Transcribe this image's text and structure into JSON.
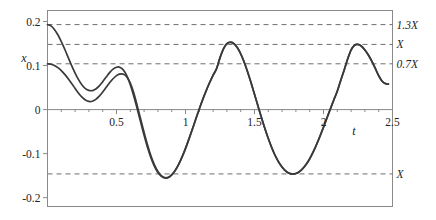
{
  "chart_data": {
    "type": "line",
    "title": "",
    "xlabel": "t",
    "ylabel": "x",
    "xlim": [
      0,
      2.5
    ],
    "ylim": [
      -0.22,
      0.225
    ],
    "grid": false,
    "legend": "none",
    "x_ticks": [
      {
        "value": 0.5,
        "label": "0.5"
      },
      {
        "value": 1.0,
        "label": "1"
      },
      {
        "value": 1.5,
        "label": "1.5"
      },
      {
        "value": 2.0,
        "label": "2"
      },
      {
        "value": 2.5,
        "label": "2.5"
      }
    ],
    "x_minor_tick_step": 0.1,
    "y_ticks": [
      {
        "value": 0.2,
        "label": "0.2"
      },
      {
        "value": 0.1,
        "label": "0.1"
      },
      {
        "value": 0.0,
        "label": "0"
      },
      {
        "value": -0.1,
        "label": "-0.1"
      },
      {
        "value": -0.2,
        "label": "-0.2"
      }
    ],
    "reference_lines": [
      {
        "id": "upper-1-3X",
        "value": 0.193,
        "label": "1.3X",
        "style": "dashed"
      },
      {
        "id": "upper-X",
        "value": 0.148,
        "label": "X",
        "style": "dashed"
      },
      {
        "id": "upper-0-7X",
        "value": 0.104,
        "label": "0.7X",
        "style": "dashed"
      },
      {
        "id": "lower-X",
        "value": -0.146,
        "label": "X",
        "style": "dashed"
      }
    ],
    "series": [
      {
        "name": "response-curve-a",
        "color": "#3a3a3a",
        "start_value": 0.193,
        "points": [
          [
            0.0,
            0.193
          ],
          [
            0.025,
            0.19
          ],
          [
            0.05,
            0.182
          ],
          [
            0.075,
            0.17
          ],
          [
            0.1,
            0.1545
          ],
          [
            0.125,
            0.137
          ],
          [
            0.15,
            0.1185
          ],
          [
            0.175,
            0.1
          ],
          [
            0.2,
            0.083
          ],
          [
            0.225,
            0.068
          ],
          [
            0.25,
            0.056
          ],
          [
            0.275,
            0.0478
          ],
          [
            0.3,
            0.0435
          ],
          [
            0.325,
            0.0432
          ],
          [
            0.35,
            0.0468
          ],
          [
            0.375,
            0.0538
          ],
          [
            0.4,
            0.0632
          ],
          [
            0.425,
            0.0738
          ],
          [
            0.45,
            0.084
          ],
          [
            0.475,
            0.092
          ],
          [
            0.5,
            0.0962
          ],
          [
            0.52,
            0.0965
          ],
          [
            0.54,
            0.093
          ],
          [
            0.56,
            0.0852
          ],
          [
            0.58,
            0.073
          ],
          [
            0.6,
            0.0566
          ],
          [
            0.625,
            0.031
          ],
          [
            0.65,
            0.002
          ],
          [
            0.675,
            -0.0285
          ],
          [
            0.7,
            -0.0585
          ],
          [
            0.725,
            -0.0862
          ],
          [
            0.75,
            -0.11
          ],
          [
            0.775,
            -0.129
          ],
          [
            0.8,
            -0.143
          ],
          [
            0.825,
            -0.1515
          ],
          [
            0.85,
            -0.1552
          ],
          [
            0.875,
            -0.154
          ],
          [
            0.9,
            -0.1482
          ],
          [
            0.925,
            -0.1382
          ],
          [
            0.95,
            -0.1245
          ],
          [
            0.975,
            -0.1075
          ],
          [
            1.0,
            -0.088
          ],
          [
            1.025,
            -0.0665
          ],
          [
            1.05,
            -0.044
          ],
          [
            1.075,
            -0.021
          ],
          [
            1.1,
            0.0015
          ],
          [
            1.125,
            0.0232
          ],
          [
            1.15,
            0.0432
          ],
          [
            1.175,
            0.0615
          ],
          [
            1.2,
            0.0782
          ],
          [
            1.225,
            0.093
          ],
          [
            1.25,
            0.118
          ],
          [
            1.275,
            0.138
          ],
          [
            1.3,
            0.15
          ],
          [
            1.325,
            0.153
          ],
          [
            1.35,
            0.15
          ],
          [
            1.375,
            0.141
          ],
          [
            1.4,
            0.1268
          ],
          [
            1.425,
            0.108
          ],
          [
            1.45,
            0.0858
          ],
          [
            1.475,
            0.061
          ],
          [
            1.5,
            0.035
          ],
          [
            1.525,
            0.0085
          ],
          [
            1.55,
            -0.0175
          ],
          [
            1.575,
            -0.0425
          ],
          [
            1.6,
            -0.0655
          ],
          [
            1.625,
            -0.0862
          ],
          [
            1.65,
            -0.1042
          ],
          [
            1.675,
            -0.119
          ],
          [
            1.7,
            -0.1305
          ],
          [
            1.725,
            -0.139
          ],
          [
            1.75,
            -0.1442
          ],
          [
            1.775,
            -0.1462
          ],
          [
            1.8,
            -0.145
          ],
          [
            1.825,
            -0.1408
          ],
          [
            1.85,
            -0.1338
          ],
          [
            1.875,
            -0.124
          ],
          [
            1.9,
            -0.1115
          ],
          [
            1.925,
            -0.0962
          ],
          [
            1.95,
            -0.079
          ],
          [
            1.975,
            -0.06
          ],
          [
            2.0,
            -0.0398
          ],
          [
            2.025,
            -0.019
          ],
          [
            2.05,
            0.0018
          ],
          [
            2.075,
            0.0222
          ],
          [
            2.1,
            0.042
          ],
          [
            2.125,
            0.0665
          ],
          [
            2.15,
            0.09
          ],
          [
            2.175,
            0.115
          ],
          [
            2.2,
            0.1355
          ],
          [
            2.225,
            0.1462
          ],
          [
            2.25,
            0.148
          ],
          [
            2.275,
            0.144
          ],
          [
            2.3,
            0.1355
          ],
          [
            2.325,
            0.124
          ],
          [
            2.35,
            0.11
          ],
          [
            2.375,
            0.094
          ],
          [
            2.4,
            0.077
          ],
          [
            2.425,
            0.0645
          ],
          [
            2.45,
            0.059
          ],
          [
            2.47,
            0.058
          ]
        ]
      },
      {
        "name": "response-curve-b",
        "color": "#3a3a3a",
        "start_value": 0.104,
        "points": [
          [
            0.0,
            0.104
          ],
          [
            0.025,
            0.103
          ],
          [
            0.05,
            0.1
          ],
          [
            0.075,
            0.0952
          ],
          [
            0.1,
            0.0885
          ],
          [
            0.125,
            0.08
          ],
          [
            0.15,
            0.07
          ],
          [
            0.175,
            0.0592
          ],
          [
            0.2,
            0.048
          ],
          [
            0.225,
            0.0372
          ],
          [
            0.25,
            0.0282
          ],
          [
            0.275,
            0.0218
          ],
          [
            0.3,
            0.0185
          ],
          [
            0.325,
            0.019
          ],
          [
            0.35,
            0.0232
          ],
          [
            0.375,
            0.0305
          ],
          [
            0.4,
            0.04
          ],
          [
            0.425,
            0.0505
          ],
          [
            0.45,
            0.061
          ],
          [
            0.475,
            0.07
          ],
          [
            0.5,
            0.077
          ],
          [
            0.52,
            0.0805
          ],
          [
            0.54,
            0.0812
          ],
          [
            0.56,
            0.0788
          ],
          [
            0.58,
            0.0718
          ],
          [
            0.6,
            0.06
          ],
          [
            0.625,
            0.038
          ],
          [
            0.65,
            0.009
          ],
          [
            0.675,
            -0.0215
          ],
          [
            0.7,
            -0.052
          ],
          [
            0.725,
            -0.0805
          ],
          [
            0.75,
            -0.1055
          ],
          [
            0.775,
            -0.1255
          ],
          [
            0.8,
            -0.1405
          ],
          [
            0.825,
            -0.15
          ],
          [
            0.85,
            -0.1545
          ],
          [
            0.875,
            -0.1538
          ],
          [
            0.9,
            -0.1482
          ],
          [
            0.925,
            -0.1385
          ],
          [
            0.95,
            -0.125
          ],
          [
            0.975,
            -0.108
          ],
          [
            1.0,
            -0.0885
          ],
          [
            1.025,
            -0.067
          ],
          [
            1.05,
            -0.0445
          ],
          [
            1.075,
            -0.0215
          ],
          [
            1.1,
            0.0012
          ],
          [
            1.125,
            0.0228
          ],
          [
            1.15,
            0.0428
          ],
          [
            1.175,
            0.0612
          ],
          [
            1.2,
            0.0778
          ],
          [
            1.225,
            0.0928
          ],
          [
            1.25,
            0.1175
          ],
          [
            1.275,
            0.1378
          ],
          [
            1.3,
            0.1498
          ],
          [
            1.325,
            0.1528
          ],
          [
            1.35,
            0.1498
          ],
          [
            1.375,
            0.1408
          ],
          [
            1.4,
            0.1265
          ],
          [
            1.425,
            0.1078
          ],
          [
            1.45,
            0.0855
          ],
          [
            1.475,
            0.0608
          ],
          [
            1.5,
            0.0348
          ],
          [
            1.525,
            0.0082
          ],
          [
            1.55,
            -0.0178
          ],
          [
            1.575,
            -0.0428
          ],
          [
            1.6,
            -0.0658
          ],
          [
            1.625,
            -0.0865
          ],
          [
            1.65,
            -0.1045
          ],
          [
            1.675,
            -0.1192
          ],
          [
            1.7,
            -0.1308
          ],
          [
            1.725,
            -0.1392
          ],
          [
            1.75,
            -0.1444
          ],
          [
            1.775,
            -0.1464
          ],
          [
            1.8,
            -0.1452
          ],
          [
            1.825,
            -0.141
          ],
          [
            1.85,
            -0.134
          ],
          [
            1.875,
            -0.1242
          ],
          [
            1.9,
            -0.1118
          ],
          [
            1.925,
            -0.0965
          ],
          [
            1.95,
            -0.0792
          ],
          [
            1.975,
            -0.0602
          ],
          [
            2.0,
            -0.04
          ],
          [
            2.025,
            -0.0192
          ],
          [
            2.05,
            0.0016
          ],
          [
            2.075,
            0.022
          ],
          [
            2.1,
            0.0418
          ],
          [
            2.125,
            0.0662
          ],
          [
            2.15,
            0.0898
          ],
          [
            2.175,
            0.1148
          ],
          [
            2.2,
            0.1352
          ],
          [
            2.225,
            0.146
          ],
          [
            2.25,
            0.1478
          ],
          [
            2.275,
            0.1438
          ],
          [
            2.3,
            0.1352
          ],
          [
            2.325,
            0.1238
          ],
          [
            2.35,
            0.1098
          ],
          [
            2.375,
            0.0938
          ],
          [
            2.4,
            0.0768
          ],
          [
            2.425,
            0.0643
          ],
          [
            2.45,
            0.0588
          ],
          [
            2.47,
            0.0578
          ]
        ]
      }
    ]
  },
  "colors": {
    "curve": "#3a3a3a",
    "frame": "#8a8a8a",
    "dashed": "#6e6e6e",
    "axis": "#8a8a8a",
    "text": "#242424",
    "background": "#ffffff"
  }
}
